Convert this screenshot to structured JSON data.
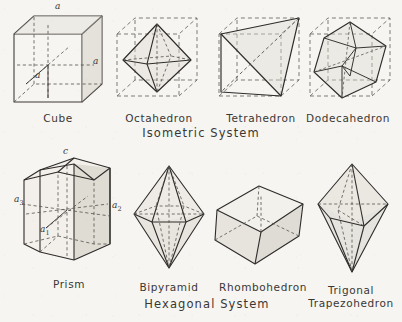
{
  "plate": {
    "title": "Crystal Systems Plate",
    "paper_color": "#f6f5f1",
    "ink_color": "#2e2c2a"
  },
  "systems": [
    {
      "name": "isometric-system",
      "label": "Isometric  System"
    },
    {
      "name": "hexagonal-system",
      "label": "Hexagonal  System"
    }
  ],
  "figures": [
    {
      "name": "cube",
      "caption": "Cube",
      "caption2": "",
      "system": "Isometric"
    },
    {
      "name": "octahedron",
      "caption": "Octahedron",
      "caption2": "",
      "system": "Isometric"
    },
    {
      "name": "tetrahedron",
      "caption": "Tetrahedron",
      "caption2": "",
      "system": "Isometric"
    },
    {
      "name": "dodecahedron",
      "caption": "Dodecahedron",
      "caption2": "",
      "system": "Isometric"
    },
    {
      "name": "prism",
      "caption": "Prism",
      "caption2": "",
      "system": "Hexagonal"
    },
    {
      "name": "bipyramid",
      "caption": "Bipyramid",
      "caption2": "",
      "system": "Hexagonal"
    },
    {
      "name": "rhombohedron",
      "caption": "Rhombohedron",
      "caption2": "",
      "system": "Hexagonal"
    },
    {
      "name": "trigonal-trapezohedron",
      "caption": "Trigonal",
      "caption2": "Trapezohedron",
      "system": "Hexagonal"
    }
  ],
  "axis_labels": {
    "cube": {
      "top": "a",
      "inner": "a",
      "right": "a"
    },
    "prism": {
      "c": "c",
      "a1": "a",
      "a1sub": "1",
      "a2": "a",
      "a2sub": "2",
      "a3": "a",
      "a3sub": "3"
    }
  }
}
